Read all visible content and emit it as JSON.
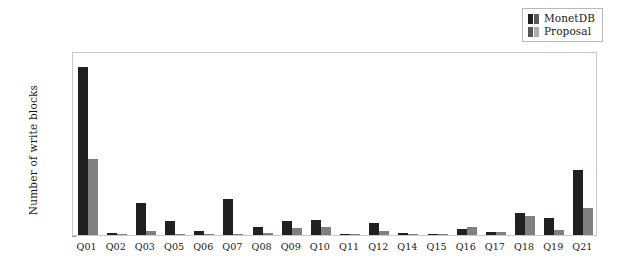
{
  "figure": {
    "legend": {
      "position": "top-right",
      "entries": [
        {
          "label": "MonetDB",
          "color": "#231f1f",
          "icon": "bar-swatch-icon"
        },
        {
          "label": "Proposal",
          "color": "#808080",
          "icon": "bar-swatch-icon"
        }
      ]
    }
  },
  "chart_data": {
    "type": "bar",
    "title": "",
    "xlabel": "",
    "ylabel": "Number of write blocks",
    "ylim": [
      0,
      52000000
    ],
    "grid": false,
    "legend_position": "top right",
    "ytick_labels": [
      "0",
      "1 · 10⁷",
      "2 · 10⁷",
      "3 · 10⁷",
      "4 · 10⁷",
      "5 · 10⁷"
    ],
    "ytick_values": [
      0,
      10000000,
      20000000,
      30000000,
      40000000,
      50000000
    ],
    "categories": [
      "Q01",
      "Q02",
      "Q03",
      "Q05",
      "Q06",
      "Q07",
      "Q08",
      "Q09",
      "Q10",
      "Q11",
      "Q12",
      "Q14",
      "Q15",
      "Q16",
      "Q17",
      "Q18",
      "Q19",
      "Q21"
    ],
    "series": [
      {
        "name": "MonetDB",
        "color": "#231f1f",
        "values": [
          47500000,
          500000,
          9100000,
          4000000,
          1000000,
          10300000,
          2200000,
          4000000,
          4300000,
          400000,
          3300000,
          700000,
          300000,
          1700000,
          800000,
          6300000,
          4800000,
          18500000
        ]
      },
      {
        "name": "Proposal",
        "color": "#808080",
        "values": [
          21600000,
          400000,
          1100000,
          100000,
          100000,
          100000,
          600000,
          1900000,
          2200000,
          300000,
          1100000,
          200000,
          200000,
          2200000,
          900000,
          5400000,
          1400000,
          7700000
        ]
      }
    ]
  }
}
